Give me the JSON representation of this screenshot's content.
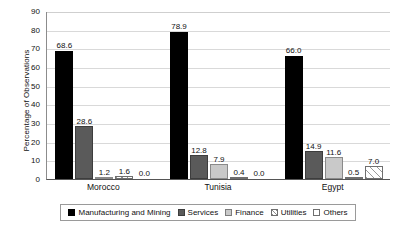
{
  "chart_data": {
    "type": "bar",
    "title": "",
    "xlabel": "",
    "ylabel": "Percentage of Observations",
    "categories": [
      "Morocco",
      "Tunisia",
      "Egypt"
    ],
    "ylim": [
      0,
      90
    ],
    "yticks": [
      0,
      10,
      20,
      30,
      40,
      50,
      60,
      70,
      80,
      90
    ],
    "ytick_labels": [
      "0",
      "10",
      "20",
      "30",
      "40",
      "50",
      "60",
      "70",
      "80",
      "90"
    ],
    "grid": true,
    "grid_axis": "y",
    "legend_position": "bottom",
    "orientation": "vertical",
    "grouping": "grouped",
    "data_labels": true,
    "series": [
      {
        "name": "Manufacturing and Mining",
        "color": "#000000",
        "pattern": "solid",
        "values": [
          68.6,
          78.9,
          66.0
        ],
        "labels": [
          "68.6",
          "78.9",
          "66.0"
        ]
      },
      {
        "name": "Services",
        "color": "#5a5a5a",
        "pattern": "solid",
        "values": [
          28.6,
          12.8,
          14.9
        ],
        "labels": [
          "28.6",
          "12.8",
          "14.9"
        ]
      },
      {
        "name": "Finance",
        "color": "#c9c9c9",
        "pattern": "solid",
        "values": [
          1.2,
          7.9,
          11.6
        ],
        "labels": [
          "1.2",
          "7.9",
          "11.6"
        ]
      },
      {
        "name": "Utilities",
        "color": "#ffffff",
        "pattern": "diagonal-hatch",
        "values": [
          1.6,
          0.4,
          0.5
        ],
        "labels": [
          "1.6",
          "0.4",
          "0.5"
        ]
      },
      {
        "name": "Others",
        "color": "#ffffff",
        "pattern": "diagonal-hatch-light",
        "values": [
          0.0,
          0.0,
          7.0
        ],
        "labels": [
          "0.0",
          "0.0",
          "7.0"
        ]
      }
    ]
  },
  "legend": {
    "items": [
      {
        "label": "Manufacturing and Mining"
      },
      {
        "label": "Services"
      },
      {
        "label": "Finance"
      },
      {
        "label": "Utilities"
      },
      {
        "label": "Others"
      }
    ]
  }
}
